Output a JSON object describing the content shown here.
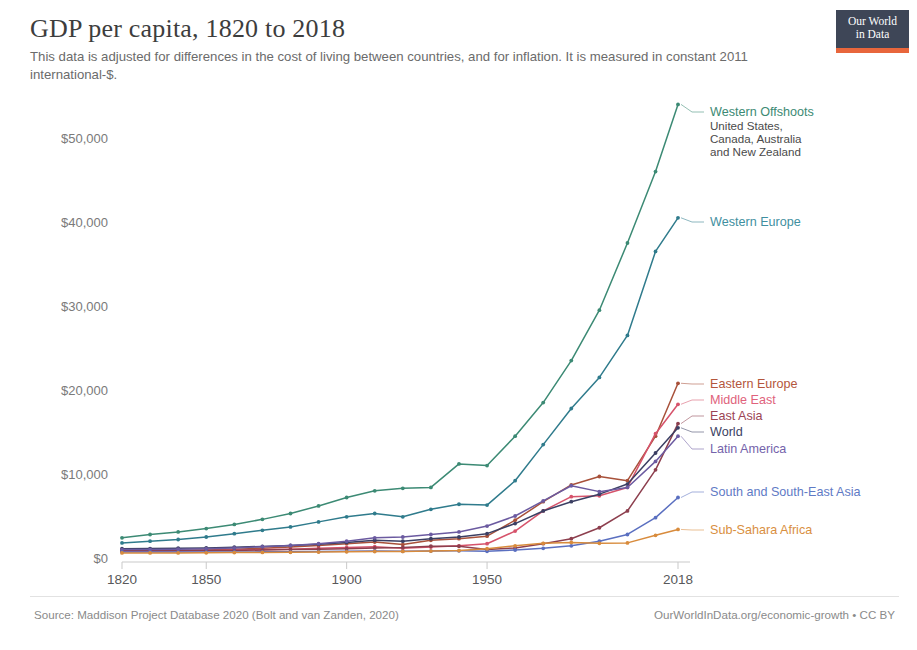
{
  "header": {
    "title": "GDP per capita, 1820 to 2018",
    "subtitle": "This data is adjusted for differences in the cost of living between countries, and for inflation. It is measured in constant 2011 international-$."
  },
  "logo": {
    "line1": "Our World",
    "line2": "in Data",
    "bg": "#3e4657",
    "accent": "#e8663c"
  },
  "footer": {
    "source": "Source: Maddison Project Database 2020 (Bolt and van Zanden, 2020)",
    "credit": "OurWorldInData.org/economic-growth • CC BY"
  },
  "chart_data": {
    "type": "line",
    "title": "GDP per capita, 1820 to 2018",
    "subtitle": "This data is adjusted for differences in the cost of living between countries, and for inflation. It is measured in constant 2011 international-$.",
    "xlabel": "",
    "ylabel": "",
    "grid": false,
    "legend_position": "right-inline",
    "xlim": [
      1820,
      2018
    ],
    "ylim": [
      0,
      56000
    ],
    "xticks": [
      1820,
      1850,
      1900,
      1950,
      2018
    ],
    "xticklabels": [
      "1820",
      "1850",
      "1900",
      "1950",
      "2018"
    ],
    "yticks": [
      0,
      10000,
      20000,
      30000,
      40000,
      50000
    ],
    "yticklabels": [
      "$0",
      "$10,000",
      "$20,000",
      "$30,000",
      "$40,000",
      "$50,000"
    ],
    "x": [
      1820,
      1830,
      1840,
      1850,
      1860,
      1870,
      1880,
      1890,
      1900,
      1910,
      1920,
      1930,
      1940,
      1950,
      1960,
      1970,
      1980,
      1990,
      2000,
      2010,
      2018
    ],
    "series": [
      {
        "name": "Western Offshoots",
        "sublabel": "United States, Canada, Australia and New Zealand",
        "color": "#3c8a74",
        "label_color": "#3c8a74",
        "values": [
          2400,
          2800,
          3100,
          3500,
          4000,
          4600,
          5300,
          6200,
          7200,
          8000,
          8300,
          8400,
          11200,
          11000,
          14500,
          18500,
          23500,
          29500,
          37500,
          46000,
          54000
        ]
      },
      {
        "name": "Western Europe",
        "sublabel": "",
        "color": "#2f7b8c",
        "label_color": "#3f8fa0",
        "values": [
          1800,
          2000,
          2200,
          2500,
          2900,
          3300,
          3700,
          4300,
          4900,
          5300,
          4900,
          5800,
          6400,
          6300,
          9200,
          13500,
          17800,
          21500,
          26500,
          36500,
          40500
        ]
      },
      {
        "name": "Eastern Europe",
        "sublabel": "",
        "color": "#a8513a",
        "label_color": "#b4563c",
        "values": [
          800,
          850,
          900,
          950,
          1050,
          1150,
          1300,
          1500,
          1700,
          1900,
          1600,
          2100,
          2300,
          2600,
          4500,
          6700,
          8700,
          9700,
          9200,
          14500,
          20800
        ]
      },
      {
        "name": "Middle East",
        "sublabel": "",
        "color": "#d6536b",
        "label_color": "#e0627c",
        "values": [
          800,
          820,
          860,
          900,
          950,
          1000,
          1050,
          1150,
          1250,
          1350,
          1150,
          1300,
          1450,
          1700,
          3200,
          5600,
          7300,
          7400,
          8400,
          14800,
          18300
        ]
      },
      {
        "name": "East Asia",
        "sublabel": "",
        "color": "#8d3f4e",
        "label_color": "#9b4454",
        "values": [
          900,
          900,
          900,
          900,
          900,
          950,
          1000,
          1050,
          1100,
          1200,
          1250,
          1400,
          1400,
          1000,
          1200,
          1700,
          2300,
          3600,
          5600,
          10500,
          16000
        ]
      },
      {
        "name": "World",
        "sublabel": "",
        "color": "#3b3f63",
        "label_color": "#3b3f63",
        "values": [
          1100,
          1120,
          1160,
          1200,
          1280,
          1380,
          1500,
          1650,
          1850,
          2100,
          2000,
          2300,
          2500,
          2900,
          4100,
          5600,
          6700,
          7600,
          8800,
          12500,
          15500
        ]
      },
      {
        "name": "Latin America",
        "sublabel": "",
        "color": "#6b5aa0",
        "label_color": "#7463ab",
        "values": [
          1000,
          1020,
          1050,
          1100,
          1200,
          1350,
          1500,
          1700,
          2000,
          2400,
          2500,
          2800,
          3100,
          3800,
          5000,
          6800,
          8600,
          7900,
          8400,
          11500,
          14500
        ]
      },
      {
        "name": "South and South-East Asia",
        "sublabel": "",
        "color": "#5a6fc0",
        "label_color": "#5f7ac5",
        "values": [
          700,
          700,
          700,
          710,
          720,
          730,
          740,
          760,
          790,
          820,
          800,
          830,
          850,
          800,
          950,
          1150,
          1450,
          2000,
          2800,
          4800,
          7200
        ]
      },
      {
        "name": "Sub-Sahara Africa",
        "sublabel": "",
        "color": "#d88b3c",
        "label_color": "#d98f3f",
        "values": [
          600,
          600,
          610,
          620,
          640,
          660,
          680,
          700,
          730,
          760,
          780,
          820,
          880,
          1100,
          1450,
          1750,
          1850,
          1750,
          1800,
          2700,
          3400
        ]
      }
    ],
    "annotations": [
      {
        "series": "Western Offshoots",
        "label_y": 112
      },
      {
        "series": "Western Europe",
        "label_y": 222
      },
      {
        "series": "Eastern Europe",
        "label_y": 384
      },
      {
        "series": "Middle East",
        "label_y": 400
      },
      {
        "series": "East Asia",
        "label_y": 416
      },
      {
        "series": "World",
        "label_y": 432
      },
      {
        "series": "Latin America",
        "label_y": 449
      },
      {
        "series": "South and South-East Asia",
        "label_y": 492
      },
      {
        "series": "Sub-Sahara Africa",
        "label_y": 530
      }
    ]
  }
}
